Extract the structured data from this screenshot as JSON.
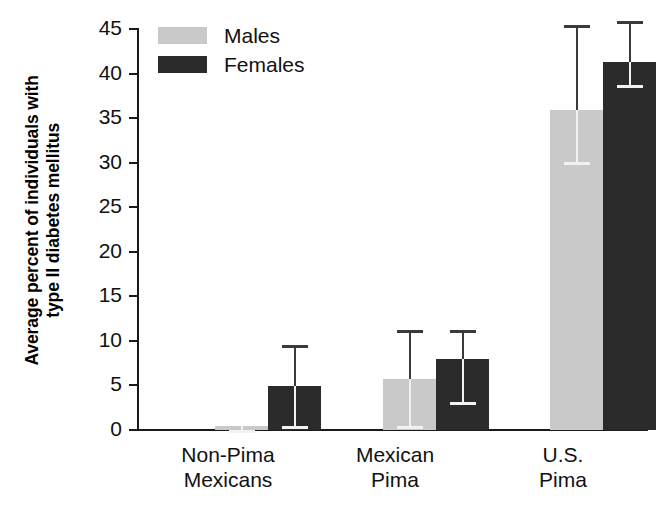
{
  "chart_data": {
    "type": "bar",
    "title": "",
    "xlabel": "",
    "ylabel": "Average percent of individuals with type II diabetes mellitus",
    "ylabel_lines": [
      "Average percent of individuals with",
      "type II diabetes mellitus"
    ],
    "ylim": [
      0,
      45
    ],
    "ytick_step": 5,
    "yticks": [
      0,
      5,
      10,
      15,
      20,
      25,
      30,
      35,
      40,
      45
    ],
    "ytick_labels": [
      "0",
      "5",
      "10",
      "15",
      "20",
      "25",
      "30",
      "35",
      "40",
      "45"
    ],
    "grid": false,
    "legend_position": "top-left-inside",
    "categories": [
      "Non-Pima Mexicans",
      "Mexican Pima",
      "U.S. Pima"
    ],
    "category_lines": [
      [
        "Non-Pima",
        "Mexicans"
      ],
      [
        "Mexican",
        "Pima"
      ],
      [
        "U.S.",
        "Pima"
      ]
    ],
    "series": [
      {
        "name": "Males",
        "color": "#c9c9c9",
        "values": [
          0.4,
          5.7,
          35.8
        ],
        "err_low": [
          0.0,
          0.4,
          30.0
        ],
        "err_high": [
          0.4,
          11.2,
          45.3
        ]
      },
      {
        "name": "Females",
        "color": "#2b2b2b",
        "values": [
          4.9,
          8.0,
          41.2
        ],
        "err_low": [
          0.5,
          3.1,
          38.6
        ],
        "err_high": [
          9.5,
          11.2,
          45.8
        ]
      }
    ],
    "annotations": []
  },
  "legend": {
    "items": [
      {
        "label": "Males",
        "color": "#c9c9c9"
      },
      {
        "label": "Females",
        "color": "#2b2b2b"
      }
    ]
  },
  "axes": {
    "y_title_line1": "Average percent of individuals with",
    "y_title_line2": "type II diabetes mellitus",
    "y_tick_0": "0",
    "y_tick_5": "5",
    "y_tick_10": "10",
    "y_tick_15": "15",
    "y_tick_20": "20",
    "y_tick_25": "25",
    "y_tick_30": "30",
    "y_tick_35": "35",
    "y_tick_40": "40",
    "y_tick_45": "45"
  },
  "x_labels": {
    "g1_line1": "Non-Pima",
    "g1_line2": "Mexicans",
    "g2_line1": "Mexican",
    "g2_line2": "Pima",
    "g3_line1": "U.S.",
    "g3_line2": "Pima"
  },
  "colors": {
    "males": "#c9c9c9",
    "females": "#2b2b2b",
    "axis": "#1a1a1a",
    "background": "#ffffff"
  }
}
